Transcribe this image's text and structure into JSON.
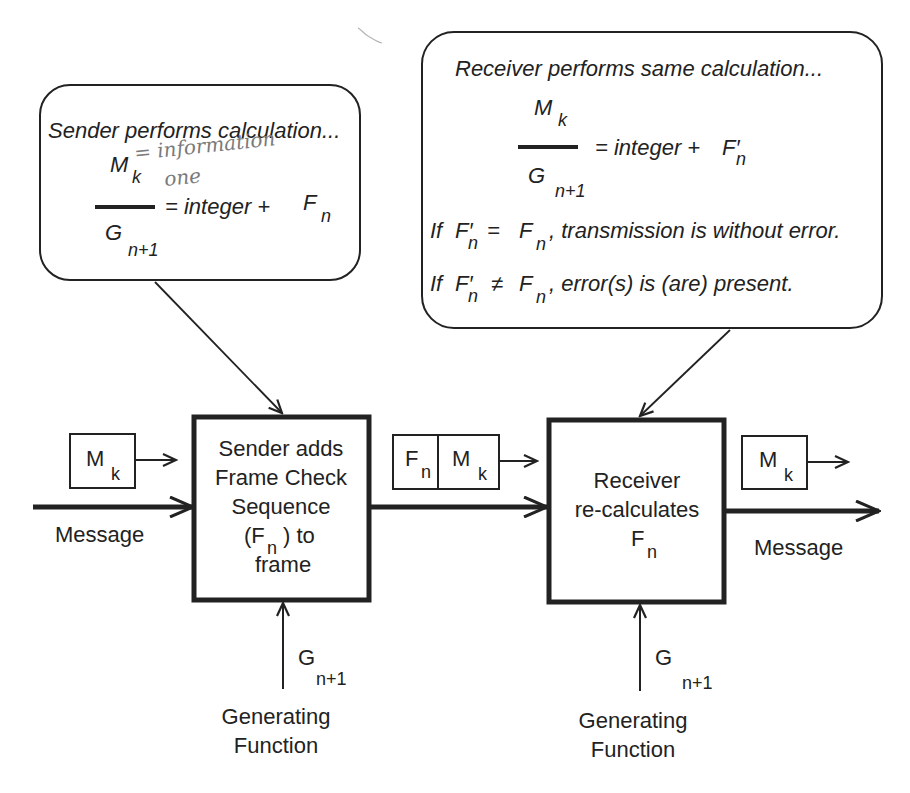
{
  "sender_callout": {
    "title": "Sender performs calculation...",
    "numerator": "M",
    "numerator_sub": "k",
    "denominator": "G",
    "denominator_sub": "n+1",
    "rhs": "= integer +",
    "rhs_symbol": "F",
    "rhs_sub": "n",
    "handwritten_note_line1": "= information",
    "handwritten_note_line2": "one"
  },
  "receiver_callout": {
    "title": "Receiver performs same calculation...",
    "numerator": "M",
    "numerator_sub": "k",
    "denominator": "G",
    "denominator_sub": "n+1",
    "rhs": "= integer +",
    "rhs_symbol": "F′",
    "rhs_sub": "n",
    "rule1_if": "If",
    "rule1_lhs": "F′",
    "rule1_lhs_sub": "n",
    "rule1_op": "=",
    "rule1_rhs": "F",
    "rule1_rhs_sub": "n",
    "rule1_text": ", transmission is without error.",
    "rule2_if": "If",
    "rule2_lhs": "F′",
    "rule2_lhs_sub": "n",
    "rule2_op": "≠",
    "rule2_rhs": "F",
    "rule2_rhs_sub": "n",
    "rule2_text": ", error(s) is (are) present."
  },
  "sender_box": {
    "line1": "Sender adds",
    "line2": "Frame Check",
    "line3": "Sequence",
    "line4_open": "(F",
    "line4_sub": "n",
    "line4_close": ") to",
    "line5": "frame"
  },
  "receiver_box": {
    "line1": "Receiver",
    "line2": "re-calculates",
    "line3": "F",
    "line3_sub": "n"
  },
  "input_frame": {
    "label": "M",
    "sub": "k"
  },
  "transmitted_frame": {
    "fcs_label": "F",
    "fcs_sub": "n",
    "msg_label": "M",
    "msg_sub": "k"
  },
  "output_frame": {
    "label": "M",
    "sub": "k"
  },
  "input_message_label": "Message",
  "output_message_label": "Message",
  "sender_generator": {
    "symbol": "G",
    "sub": "n+1",
    "label_line1": "Generating",
    "label_line2": "Function"
  },
  "receiver_generator": {
    "symbol": "G",
    "sub": "n+1",
    "label_line1": "Generating",
    "label_line2": "Function"
  },
  "colors": {
    "ink": "#222222",
    "background": "#ffffff",
    "pencil": "#7a7a7a"
  }
}
